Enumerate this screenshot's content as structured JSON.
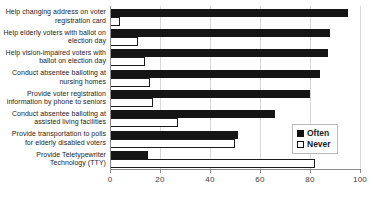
{
  "chart_data": {
    "type": "bar",
    "orientation": "horizontal",
    "title": "",
    "xlabel": "",
    "ylabel": "",
    "xlim": [
      0,
      100
    ],
    "xticks": [
      0,
      20,
      40,
      60,
      80,
      100
    ],
    "grid": true,
    "legend_position": "right-inside",
    "categories": [
      "Help changing address on voter registration card",
      "Help elderly voters with ballot on election day",
      "Help vision-impaired voters with ballot on election day",
      "Conduct absentee balloting at nursing homes",
      "Provide voter registration information by phone to seniors",
      "Conduct absentee balloting at assisted living facilities",
      "Provide transportation to polls for elderly disabled voters",
      "Provide Teletypewriter Technology (TTY)"
    ],
    "series": [
      {
        "name": "Often",
        "color": "#151515",
        "values": [
          95,
          88,
          87,
          84,
          80,
          66,
          51,
          15
        ]
      },
      {
        "name": "Never",
        "color": "#ffffff",
        "values": [
          4,
          11,
          14,
          16,
          17,
          27,
          50,
          82
        ]
      }
    ]
  },
  "legend": {
    "items": [
      {
        "label": "Often"
      },
      {
        "label": "Never"
      }
    ]
  },
  "axis": {
    "tick_labels": [
      "0",
      "20",
      "40",
      "60",
      "80",
      "100"
    ]
  }
}
